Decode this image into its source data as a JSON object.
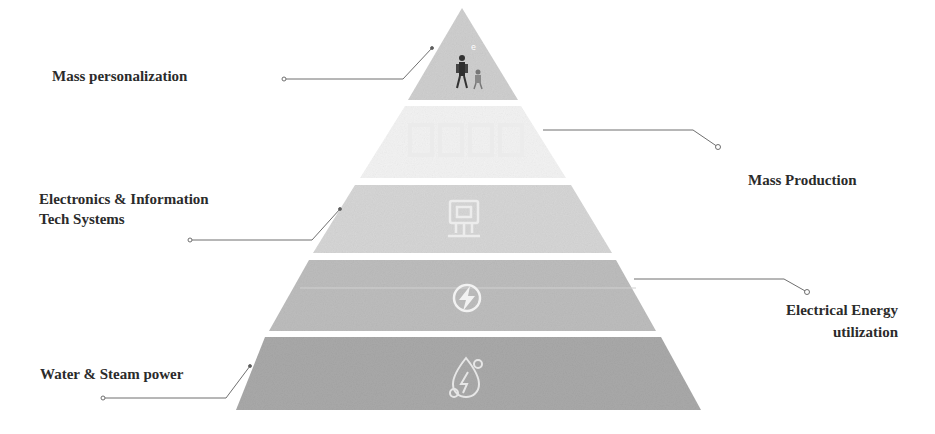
{
  "diagram": {
    "type": "pyramid",
    "levels": [
      {
        "id": "top",
        "label": "Mass personalization",
        "icon": "people-icon",
        "fill": "#cfcfcf",
        "side": "left"
      },
      {
        "id": "second",
        "label": "Mass Production",
        "icon": "factory-icon",
        "fill": "#f3f3f3",
        "side": "right"
      },
      {
        "id": "third",
        "label_lines": [
          "Electronics & Information",
          "Tech Systems"
        ],
        "icon": "computer-chip-icon",
        "fill": "#d6d6d6",
        "side": "left"
      },
      {
        "id": "fourth",
        "label_lines": [
          "Electrical Energy",
          "utilization"
        ],
        "icon": "lightning-bolt-icon",
        "fill": "#bdbdbd",
        "side": "right"
      },
      {
        "id": "bottom",
        "label": "Water & Steam power",
        "icon": "water-steam-icon",
        "fill": "#a9a9a9",
        "side": "left"
      }
    ]
  }
}
